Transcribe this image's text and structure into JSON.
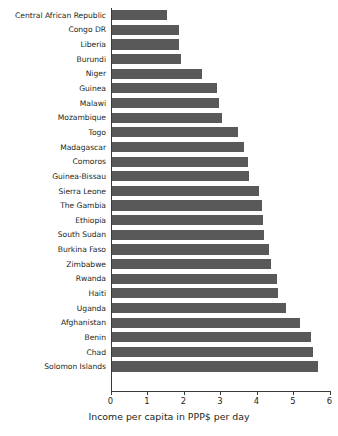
{
  "chart_data": {
    "type": "bar",
    "orientation": "horizontal",
    "title": "",
    "xlabel": "Income per capita in PPP$ per day",
    "ylabel": "",
    "xlim": [
      0,
      6
    ],
    "xticks": [
      0,
      1,
      2,
      3,
      4,
      5,
      6
    ],
    "xtick_labels": [
      "0",
      "1",
      "2",
      "3",
      "4",
      "5",
      "6"
    ],
    "grid": false,
    "legend": false,
    "bar_color": "#595959",
    "categories": [
      "Central African Republic",
      "Congo DR",
      "Liberia",
      "Burundi",
      "Niger",
      "Guinea",
      "Malawi",
      "Mozambique",
      "Togo",
      "Madagascar",
      "Comoros",
      "Guinea-Bissau",
      "Sierra Leone",
      "The Gambia",
      "Ethiopia",
      "South Sudan",
      "Burkina Faso",
      "Zimbabwe",
      "Rwanda",
      "Haiti",
      "Uganda",
      "Afghanistan",
      "Benin",
      "Chad",
      "Solomon Islands"
    ],
    "values": [
      1.54,
      1.87,
      1.87,
      1.93,
      2.5,
      2.93,
      2.97,
      3.06,
      3.5,
      3.65,
      3.77,
      3.8,
      4.07,
      4.15,
      4.18,
      4.2,
      4.35,
      4.4,
      4.55,
      4.6,
      4.8,
      5.2,
      5.5,
      5.55,
      5.68
    ]
  }
}
